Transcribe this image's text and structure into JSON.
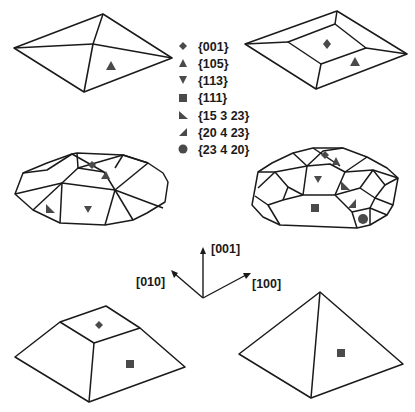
{
  "figure": {
    "legend": [
      {
        "symbol": "diamond-icon",
        "label": "{001}"
      },
      {
        "symbol": "triangle-up-icon",
        "label": "{105}"
      },
      {
        "symbol": "triangle-down-icon",
        "label": "{113}"
      },
      {
        "symbol": "square-icon",
        "label": "{111}"
      },
      {
        "symbol": "right-triangle-icon",
        "label": "{15 3 23}"
      },
      {
        "symbol": "left-triangle-icon",
        "label": "{20 4 23}"
      },
      {
        "symbol": "circle-icon",
        "label": "{23 4 20}"
      }
    ],
    "axes": {
      "z_label": "[001]",
      "y_label": "[010]",
      "x_label": "[100]"
    },
    "shapes": [
      {
        "name": "pyramid-105",
        "facets": [
          "{105}"
        ]
      },
      {
        "name": "truncated-pyramid-105",
        "facets": [
          "{001}",
          "{105}"
        ]
      },
      {
        "name": "dome",
        "facets": [
          "{001}",
          "{105}",
          "{113}",
          "{15 3 23}"
        ]
      },
      {
        "name": "barn",
        "facets": [
          "{001}",
          "{105}",
          "{113}",
          "{111}",
          "{15 3 23}",
          "{20 4 23}",
          "{23 4 20}"
        ]
      },
      {
        "name": "truncated-pyramid-111",
        "facets": [
          "{001}",
          "{111}"
        ]
      },
      {
        "name": "pyramid-111",
        "facets": [
          "{111}"
        ]
      }
    ],
    "colors": {
      "line": "#1a1a1a",
      "marker": "#4a4a4a",
      "background": "#ffffff"
    }
  }
}
